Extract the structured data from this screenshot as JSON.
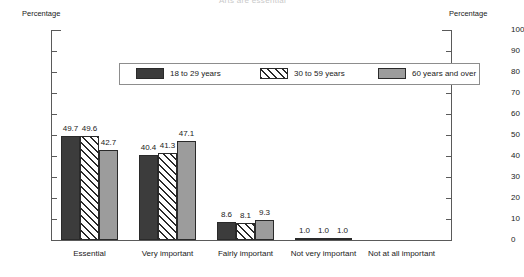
{
  "chart_data": {
    "type": "bar",
    "title": "Arts are essential",
    "xlabel": "",
    "ylabel": "Percentage",
    "ylabel_right": "Percentage",
    "ylim": [
      0,
      100
    ],
    "yticks": [
      100,
      90,
      80,
      70,
      60,
      50,
      40,
      30,
      20,
      10,
      0
    ],
    "grid": false,
    "legend_position": "top",
    "categories": [
      "Essential",
      "Very important",
      "Fairly important",
      "Not very important",
      "Not at all important"
    ],
    "series": [
      {
        "name": "18 to 29 years",
        "fill": "solid-dark",
        "color": "#3c3c3c",
        "values": [
          49.7,
          40.4,
          8.6,
          1.0,
          null
        ],
        "labels": [
          "49.7",
          "40.4",
          "8.6",
          "1.0",
          ""
        ]
      },
      {
        "name": "30 to 59 years",
        "fill": "diagonal-hatch",
        "color": "#ffffff",
        "values": [
          49.6,
          41.3,
          8.1,
          1.0,
          null
        ],
        "labels": [
          "49.6",
          "41.3",
          "8.1",
          "1.0",
          ""
        ]
      },
      {
        "name": "60 years and over",
        "fill": "solid-gray",
        "color": "#9c9c9c",
        "values": [
          42.7,
          47.1,
          9.3,
          1.0,
          null
        ],
        "labels": [
          "42.7",
          "47.1",
          "9.3",
          "1.0",
          ""
        ]
      }
    ]
  }
}
